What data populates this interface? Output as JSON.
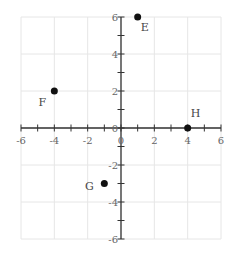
{
  "chart_data": {
    "type": "scatter",
    "title": "",
    "xlabel": "",
    "ylabel": "",
    "xlim": [
      -6,
      6
    ],
    "ylim": [
      -6,
      6
    ],
    "grid": true,
    "x_tick_labels": [
      "-6",
      "-4",
      "-2",
      "0",
      "2",
      "4",
      "6"
    ],
    "y_tick_labels": [
      "6",
      "4",
      "2",
      "0",
      "-2",
      "-4",
      "-6"
    ],
    "points": [
      {
        "label": "E",
        "x": 1,
        "y": 6
      },
      {
        "label": "F",
        "x": -4,
        "y": 2
      },
      {
        "label": "G",
        "x": -1,
        "y": -3
      },
      {
        "label": "H",
        "x": 4,
        "y": 0
      }
    ]
  },
  "style": {
    "grid_color": "#e6e6e6",
    "axis_color": "#333333",
    "point_color": "#111111",
    "background": "#ffffff"
  }
}
